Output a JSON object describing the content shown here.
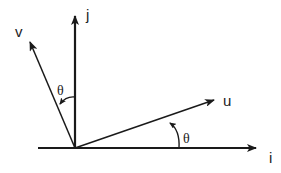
{
  "diagram": {
    "labels": {
      "i": "i",
      "j": "j",
      "u": "u",
      "v": "v",
      "theta_u": "θ",
      "theta_v": "θ"
    },
    "colors": {
      "stroke": "#1a1a1a",
      "background": "#ffffff"
    }
  }
}
